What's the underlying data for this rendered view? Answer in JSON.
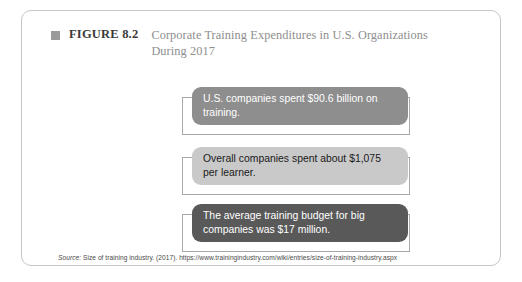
{
  "figure": {
    "marker_icon": "filled-square-icon",
    "label": "FIGURE 8.2",
    "title_line_1": "Corporate Training Expenditures in U.S. Organizations",
    "title_line_2": "During 2017"
  },
  "callouts": [
    {
      "text": "U.S. companies spent $90.6 billion on training.",
      "fill_color": "#8e8e8e",
      "text_color": "#ffffff"
    },
    {
      "text": "Overall companies spent about $1,075 per learner.",
      "fill_color": "#c9c9c9",
      "text_color": "#1a1a1a"
    },
    {
      "text": "The average training budget for big companies was $17 million.",
      "fill_color": "#595959",
      "text_color": "#ffffff"
    }
  ],
  "source": {
    "prefix": "Source:",
    "citation": "Size of training industry. (2017). https://www.trainingindustry.com/wiki/entries/size-of-training-industry.aspx"
  },
  "colors": {
    "frame_border": "#c6c6c6",
    "title_text": "#8e8e8e",
    "label_text": "#3a3a3a",
    "outline_box_border": "#a8a8a8"
  }
}
